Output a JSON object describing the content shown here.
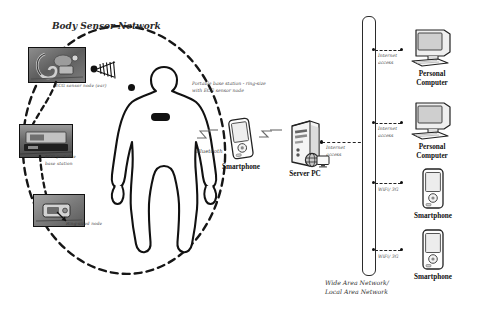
{
  "diagram": {
    "title": "Body Sensor Network",
    "bottom_caption_line1": "Wide Area Network/",
    "bottom_caption_line2": "Local Area Network"
  },
  "bsn": {
    "photo_top_label": "ECG sensor node (ear)",
    "photo_mid_label_line1": "ECG portable",
    "photo_mid_label_line2": "base station",
    "photo_bottom_label": "Ring-sized node",
    "body_note_line1": "Portable base station - ring-size",
    "body_note_line2": "with ECG sensor node",
    "wireless_icon": "wireless-signal-icon"
  },
  "links": {
    "bluetooth": "Bluetooth",
    "internet_access_line1": "Internet",
    "internet_access_line2": "access",
    "wifi_3g": "WiFi/ 3G"
  },
  "devices": {
    "smartphone_center": "Smartphone",
    "server_pc": "Server PC",
    "right": [
      {
        "name": "Personal",
        "name2": "Computer",
        "link_l1": "Internet",
        "link_l2": "access",
        "icon": "desktop-computer-icon"
      },
      {
        "name": "Personal",
        "name2": "Computer",
        "link_l1": "Internet",
        "link_l2": "access",
        "icon": "desktop-computer-icon"
      },
      {
        "name": "Smartphone",
        "name2": "",
        "link_l1": "WiFi/ 3G",
        "link_l2": "",
        "icon": "smartphone-icon"
      },
      {
        "name": "Smartphone",
        "name2": "",
        "link_l1": "WiFi/ 3G",
        "link_l2": "",
        "icon": "smartphone-icon"
      }
    ]
  },
  "colors": {
    "ink": "#111111",
    "paper": "#ffffff",
    "photo_grey": "#6e6e6e"
  }
}
